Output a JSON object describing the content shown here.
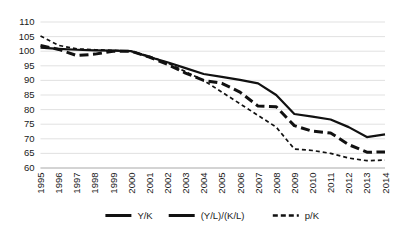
{
  "chart_data": {
    "type": "line",
    "title": "",
    "subtitle": "",
    "xlabel": "",
    "ylabel": "",
    "ylim": [
      60,
      110
    ],
    "ytick_step": 5,
    "yticks": [
      60,
      65,
      70,
      75,
      80,
      85,
      90,
      95,
      100,
      105,
      110
    ],
    "grid": true,
    "grid_axis": "y",
    "legend_position": "bottom",
    "categories": [
      "1995",
      "1996",
      "1997",
      "1998",
      "1999",
      "1900-placeholder-unused",
      "2001",
      "2002",
      "2003",
      "2004",
      "2005",
      "2006",
      "2007",
      "2008",
      "2009",
      "2010",
      "2011",
      "2012",
      "2013",
      "2014"
    ],
    "x": [
      "1995",
      "1996",
      "1997",
      "1998",
      "1999",
      "2000",
      "2001",
      "2002",
      "2003",
      "2004",
      "2005",
      "2006",
      "2007",
      "2008",
      "2009",
      "2010",
      "2011",
      "2012",
      "2013",
      "2014"
    ],
    "series": [
      {
        "name": "Y/K",
        "style": "solid",
        "color": "#111111",
        "width": 2.2,
        "values": [
          101.2,
          100.8,
          100.5,
          100.3,
          100.2,
          100.0,
          98.0,
          96.2,
          94.2,
          92.2,
          91.2,
          90.2,
          89.0,
          85.0,
          78.5,
          77.6,
          76.6,
          74.0,
          70.6,
          71.5
        ]
      },
      {
        "name": "(Y/L)/(K/L)",
        "style": "long-dash",
        "color": "#111111",
        "width": 3.0,
        "values": [
          102.0,
          100.6,
          98.5,
          99.0,
          100.0,
          100.0,
          98.0,
          95.5,
          92.5,
          90.0,
          89.0,
          86.0,
          81.2,
          81.0,
          74.5,
          72.6,
          72.0,
          68.0,
          65.4,
          65.5
        ]
      },
      {
        "name": "p/K",
        "style": "dashed",
        "color": "#111111",
        "width": 1.7,
        "values": [
          105.2,
          102.0,
          100.8,
          100.5,
          100.3,
          100.0,
          98.3,
          96.0,
          93.0,
          90.0,
          86.0,
          82.0,
          78.0,
          74.0,
          66.5,
          66.0,
          65.0,
          63.4,
          62.5,
          62.7
        ]
      }
    ],
    "legend": [
      {
        "label": "Y/K",
        "style": "solid"
      },
      {
        "label": "(Y/L)/(K/L)",
        "style": "solid"
      },
      {
        "label": "p/K",
        "style": "dashed"
      }
    ]
  }
}
